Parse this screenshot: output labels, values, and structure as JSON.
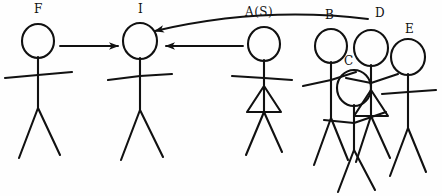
{
  "diagram": {
    "style": "hand-drawn black ink on white",
    "stroke_color": "#111111",
    "background_color": "#fefefe",
    "figures": [
      {
        "id": "F",
        "label": "F",
        "label_x": 34,
        "label_y": 2,
        "head_cx": 38,
        "head_cy": 41,
        "head_r": 16,
        "skirt": false,
        "spine_top": 57,
        "spine_bottom": 108,
        "arms": [
          [
            5,
            78
          ],
          [
            72,
            72
          ]
        ],
        "legs": [
          [
            19,
            158
          ],
          [
            60,
            155
          ]
        ]
      },
      {
        "id": "I",
        "label": "I",
        "label_x": 138,
        "label_y": 2,
        "head_cx": 140,
        "head_cy": 41,
        "head_r": 17,
        "skirt": false,
        "spine_top": 58,
        "spine_bottom": 110,
        "arms": [
          [
            108,
            80
          ],
          [
            172,
            74
          ]
        ],
        "legs": [
          [
            121,
            160
          ],
          [
            163,
            157
          ]
        ]
      },
      {
        "id": "A(S)",
        "label": "A(S)",
        "label_x": 245,
        "label_y": 5,
        "head_cx": 264,
        "head_cy": 44,
        "head_r": 16,
        "skirt": true,
        "spine_top": 60,
        "spine_bottom": 112,
        "arms": [
          [
            232,
            76
          ],
          [
            292,
            80
          ]
        ],
        "legs": [
          [
            246,
            155
          ],
          [
            282,
            152
          ]
        ]
      },
      {
        "id": "B",
        "label": "B",
        "label_x": 325,
        "label_y": 8,
        "head_cx": 331,
        "head_cy": 46,
        "head_r": 16,
        "skirt": false,
        "spine_top": 62,
        "spine_bottom": 118,
        "arms": [
          [
            303,
            86
          ],
          [
            356,
            72
          ]
        ],
        "legs": [
          [
            314,
            165
          ],
          [
            348,
            160
          ]
        ]
      },
      {
        "id": "C",
        "label": "C",
        "label_x": 344,
        "label_y": 54,
        "head_cx": 354,
        "head_cy": 88,
        "head_r": 17,
        "skirt": false,
        "spine_top": 105,
        "spine_bottom": 150,
        "arms": [
          [
            324,
            120
          ],
          [
            386,
            112
          ]
        ],
        "legs": [
          [
            338,
            192
          ],
          [
            375,
            190
          ]
        ]
      },
      {
        "id": "D",
        "label": "D",
        "label_x": 375,
        "label_y": 6,
        "head_cx": 371,
        "head_cy": 48,
        "head_r": 17,
        "skirt": true,
        "spine_top": 65,
        "spine_bottom": 116,
        "arms": [
          [
            346,
            78
          ],
          [
            398,
            74
          ]
        ],
        "legs": [
          [
            356,
            162
          ],
          [
            390,
            158
          ]
        ]
      },
      {
        "id": "E",
        "label": "E",
        "label_x": 405,
        "label_y": 22,
        "head_cx": 408,
        "head_cy": 57,
        "head_r": 17,
        "skirt": false,
        "spine_top": 74,
        "spine_bottom": 128,
        "arms": [
          [
            382,
            94
          ],
          [
            436,
            90
          ]
        ],
        "legs": [
          [
            390,
            176
          ],
          [
            426,
            172
          ]
        ]
      }
    ],
    "arrows": [
      {
        "id": "arrow-f-to-i",
        "from": "F",
        "to": "I",
        "shape": "straight",
        "x1": 60,
        "y1": 46,
        "x2": 118,
        "y2": 46
      },
      {
        "id": "arrow-a-to-i",
        "from": "A(S)",
        "to": "I",
        "shape": "straight",
        "x1": 243,
        "y1": 46,
        "x2": 166,
        "y2": 46
      },
      {
        "id": "arrow-d-to-i",
        "from": "D",
        "to": "I",
        "shape": "curved",
        "x1": 368,
        "y1": 19,
        "x2": 155,
        "y2": 31
      }
    ]
  }
}
